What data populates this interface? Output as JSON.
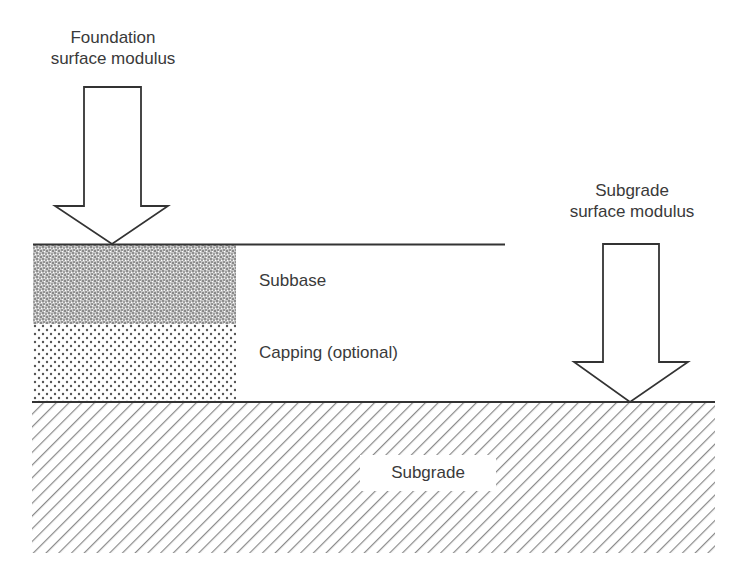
{
  "diagram": {
    "type": "pavement foundation layer cross-section",
    "arrows": [
      {
        "id": "foundation",
        "label_lines": [
          "Foundation",
          "surface modulus"
        ],
        "direction": "down",
        "target": "top of subbase"
      },
      {
        "id": "subgrade",
        "label_lines": [
          "Subgrade",
          "surface modulus"
        ],
        "direction": "down",
        "target": "top of subgrade"
      }
    ],
    "layers": [
      {
        "id": "subbase",
        "label": "Subbase",
        "pattern": "dense-speckle"
      },
      {
        "id": "capping",
        "label": "Capping (optional)",
        "pattern": "dots"
      },
      {
        "id": "subgrade",
        "label": "Subgrade",
        "pattern": "diagonal-hatch"
      }
    ],
    "colors": {
      "line": "#333333",
      "text": "#3a3a3a",
      "hatch": "#8a8a8a",
      "speckle": "#9a9a9a",
      "dot": "#555555",
      "background": "#ffffff"
    }
  }
}
